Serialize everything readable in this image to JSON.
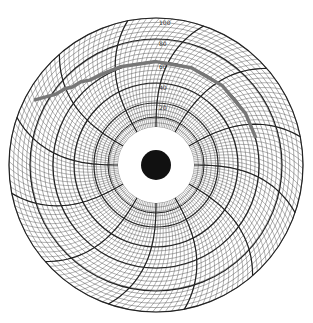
{
  "chart_data": {
    "type": "line",
    "subtype": "circular-recorder-chart",
    "title": "",
    "center": [
      156,
      165
    ],
    "outer_radius": 147,
    "hole_radius": 38,
    "hub_radius": 15,
    "radial_scale": {
      "min": 0,
      "max": 100,
      "major_ring_labels": [
        "20",
        "40",
        "60",
        "80",
        "100"
      ],
      "major_ring_radii": [
        62,
        82,
        103,
        126,
        147
      ],
      "minor_divisions_per_major": 5
    },
    "time_divisions": 12,
    "grid": true,
    "trace": {
      "color": "#777777",
      "description": "Recorded pen trace starting near outer-left edge, rising in a stepped pattern to roughly the 60-level ring, then holding steady clockwise across the top toward the right side",
      "points_angle_deg_value": [
        [
          -62,
          92
        ],
        [
          -55,
          78
        ],
        [
          -50,
          74
        ],
        [
          -47,
          70
        ],
        [
          -42,
          68
        ],
        [
          -38,
          64
        ],
        [
          -30,
          62
        ],
        [
          -20,
          61
        ],
        [
          0,
          60
        ],
        [
          20,
          60
        ],
        [
          40,
          60
        ],
        [
          60,
          60
        ],
        [
          75,
          60
        ]
      ]
    },
    "colors": {
      "grid": "#222222",
      "fine_grid": "#555555",
      "trace": "#777777",
      "hub": "#111111",
      "background": "#ffffff"
    }
  }
}
